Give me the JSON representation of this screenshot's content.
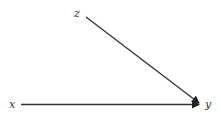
{
  "diagram": {
    "nodes": [
      {
        "id": "z",
        "label": "z"
      },
      {
        "id": "x",
        "label": "x"
      },
      {
        "id": "y",
        "label": "y"
      }
    ],
    "edges": [
      {
        "from": "z",
        "to": "y"
      },
      {
        "from": "x",
        "to": "y"
      }
    ],
    "colors": {
      "stroke": "#333333",
      "background": "#ffffff"
    }
  }
}
